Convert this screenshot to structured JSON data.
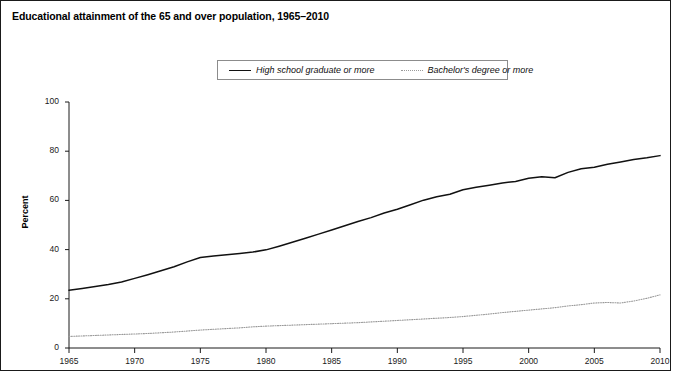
{
  "figure": {
    "title": "Educational attainment of the 65 and over population, 1965–2010",
    "border_color": "#1a1a1a",
    "background": "#ffffff"
  },
  "legend": {
    "position": "top-center",
    "entries": [
      {
        "label": "High school graduate or more",
        "style": "solid",
        "color": "#111111"
      },
      {
        "label": "Bachelor's degree or more",
        "style": "dotted",
        "color": "#9a9a9a"
      }
    ]
  },
  "axes": {
    "y_title": "Percent",
    "y_ticks": [
      "0",
      "20",
      "40",
      "60",
      "80",
      "100"
    ],
    "x_ticks": [
      "1965",
      "1970",
      "1975",
      "1980",
      "1985",
      "1990",
      "1995",
      "2000",
      "2005",
      "2010"
    ]
  },
  "chart_data": {
    "type": "line",
    "title": "Educational attainment of the 65 and over population, 1965–2010",
    "xlabel": "",
    "ylabel": "Percent",
    "xlim": [
      1965,
      2010
    ],
    "ylim": [
      0,
      100
    ],
    "grid": false,
    "legend_position": "top-center",
    "x": [
      1965,
      1966,
      1967,
      1968,
      1969,
      1970,
      1971,
      1972,
      1973,
      1974,
      1975,
      1976,
      1977,
      1978,
      1979,
      1980,
      1981,
      1982,
      1983,
      1984,
      1985,
      1986,
      1987,
      1988,
      1989,
      1990,
      1991,
      1992,
      1993,
      1994,
      1995,
      1996,
      1997,
      1998,
      1999,
      2000,
      2001,
      2002,
      2003,
      2004,
      2005,
      2006,
      2007,
      2008,
      2009,
      2010
    ],
    "series": [
      {
        "name": "High school graduate or more",
        "style": "solid",
        "color": "#111111",
        "values": [
          23.5,
          24.2,
          25.0,
          25.8,
          26.8,
          28.3,
          29.8,
          31.4,
          33.0,
          35.0,
          36.8,
          37.4,
          37.9,
          38.4,
          39.0,
          39.9,
          41.4,
          43.0,
          44.6,
          46.3,
          48.0,
          49.7,
          51.4,
          53.0,
          54.9,
          56.4,
          58.2,
          60.1,
          61.5,
          62.5,
          64.3,
          65.3,
          66.2,
          67.1,
          67.7,
          69.0,
          69.6,
          69.2,
          71.4,
          72.9,
          73.5,
          74.7,
          75.6,
          76.6,
          77.3,
          78.2
        ]
      },
      {
        "name": "Bachelor's degree or more",
        "style": "dotted",
        "color": "#9a9a9a",
        "values": [
          4.7,
          4.9,
          5.1,
          5.3,
          5.5,
          5.7,
          5.9,
          6.2,
          6.5,
          6.9,
          7.3,
          7.6,
          7.9,
          8.2,
          8.6,
          8.9,
          9.1,
          9.3,
          9.5,
          9.7,
          9.9,
          10.1,
          10.3,
          10.6,
          10.9,
          11.2,
          11.5,
          11.8,
          12.1,
          12.4,
          12.8,
          13.3,
          13.8,
          14.4,
          14.9,
          15.4,
          15.9,
          16.4,
          17.1,
          17.6,
          18.3,
          18.5,
          18.3,
          19.1,
          20.2,
          21.6
        ]
      }
    ]
  }
}
